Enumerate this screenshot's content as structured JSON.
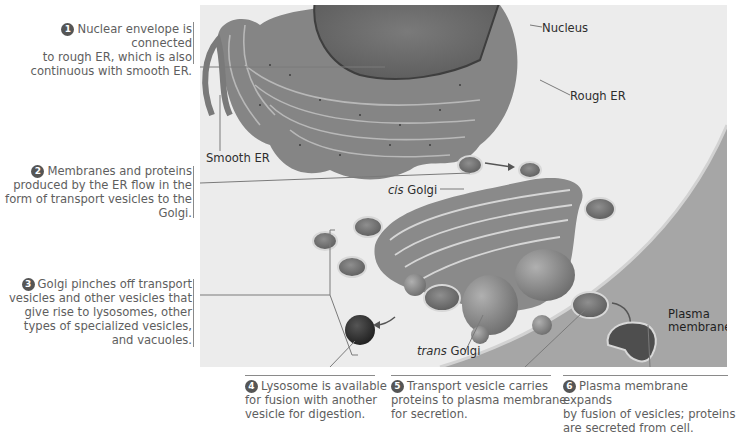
{
  "figure": {
    "structure_labels": {
      "nucleus": "Nucleus",
      "rough_er": "Rough ER",
      "smooth_er": "Smooth ER",
      "cis_golgi_italic": "cis",
      "cis_golgi_rest": " Golgi",
      "trans_golgi_italic": "trans",
      "trans_golgi_rest": " Golgi",
      "plasma_membrane_line1": "Plasma",
      "plasma_membrane_line2": "membrane"
    },
    "steps": [
      {
        "number": "1",
        "lines": [
          "Nuclear envelope is connected",
          "to rough ER, which is also",
          "continuous with smooth ER."
        ]
      },
      {
        "number": "2",
        "lines": [
          "Membranes and proteins",
          "produced by the ER flow in the",
          "form of transport vesicles to the",
          "Golgi."
        ]
      },
      {
        "number": "3",
        "lines": [
          "Golgi pinches off transport",
          "vesicles and other vesicles that",
          "give rise to lysosomes, other",
          "types of specialized vesicles,",
          "and vacuoles."
        ]
      },
      {
        "number": "4",
        "lines": [
          "Lysosome is available",
          "for fusion with another",
          "vesicle for digestion."
        ]
      },
      {
        "number": "5",
        "lines": [
          "Transport vesicle carries",
          "proteins to plasma membrane",
          "for secretion."
        ]
      },
      {
        "number": "6",
        "lines": [
          "Plasma membrane expands",
          "by fusion of vesicles; proteins",
          "are secreted from cell."
        ]
      }
    ],
    "colors": {
      "panel_bg": "#ececec",
      "organelle": "#8c8c8c",
      "organelle_dark": "#5a5a5a",
      "text": "#5e5e5e",
      "step_badge": "#555555"
    }
  }
}
